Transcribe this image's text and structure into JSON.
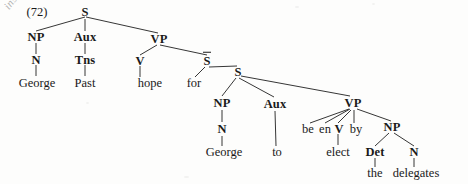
{
  "figure": {
    "number": "(72)",
    "type": "syntax-tree",
    "annotation": "insertion"
  },
  "nodes": {
    "s_top": "S",
    "np1": "NP",
    "n1": "N",
    "aux1": "Aux",
    "tns": "Tns",
    "vp1": "VP",
    "v1": "V",
    "sbar": "S",
    "s_low": "S",
    "np2": "NP",
    "n2": "N",
    "aux2": "Aux",
    "vp2": "VP",
    "be": "be",
    "en": "en",
    "v2": "V",
    "by": "by",
    "np3": "NP",
    "det": "Det",
    "n3": "N"
  },
  "words": {
    "george1": "George",
    "past": "Past",
    "hope": "hope",
    "for": "for",
    "george2": "George",
    "to": "to",
    "elect": "elect",
    "the": "the",
    "delegates": "delegates"
  },
  "colors": {
    "ink": "#1a1a1a",
    "edge": "#1f1f1f",
    "page": "#fdfdfc",
    "annotation": "#9a9a9a"
  }
}
